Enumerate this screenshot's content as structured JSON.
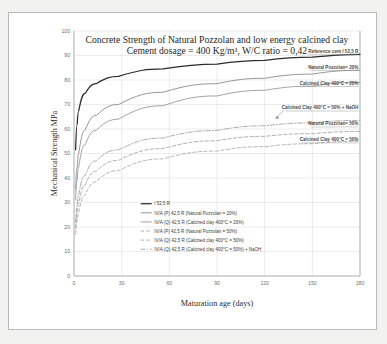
{
  "chart_data": {
    "type": "line",
    "title": "Concrete Strength of Natural Pozzolan and low energy calcined clay",
    "subtitle": "Cement dosage = 400 Kg/m³, W/C ratio = 0,42",
    "xlabel": "Maturation age (days)",
    "ylabel": "Mechanical Strength MPa",
    "xlim": [
      0,
      180
    ],
    "ylim": [
      0,
      100
    ],
    "xticks": [
      "0",
      "30",
      "60",
      "90",
      "120",
      "150",
      "180"
    ],
    "yticks": [
      "0",
      "10",
      "20",
      "30",
      "40",
      "50",
      "60",
      "70",
      "80",
      "90",
      "100"
    ],
    "grid": true,
    "legend_position": "inside-lower-center",
    "x": [
      1,
      2,
      3,
      7,
      14,
      28,
      56,
      90,
      120,
      150,
      180
    ],
    "series": [
      {
        "name": "I 52,5 R",
        "color": "#2b2b2b",
        "dash": "solid",
        "width": 1.25,
        "values": [
          51.5,
          62.0,
          67.5,
          74.5,
          78.5,
          81.5,
          84.5,
          86.5,
          88.0,
          89.3,
          90.5
        ]
      },
      {
        "name": "IV/A (P) 42,5 R  (Natural Pozzolan = 20%)",
        "color": "#8a8a8a",
        "dash": "solid",
        "width": 0.9,
        "values": [
          35.5,
          44.0,
          50.0,
          59.5,
          65.5,
          70.0,
          75.0,
          78.5,
          80.7,
          82.4,
          84.0
        ]
      },
      {
        "name": "IV/A (Q) 42,5 R  (Calcined clay 400°C = 20%)",
        "color": "#9a9a9a",
        "dash": "solid",
        "width": 0.9,
        "values": [
          31.0,
          39.0,
          44.5,
          53.5,
          59.5,
          64.0,
          69.5,
          73.5,
          75.8,
          77.5,
          79.0
        ]
      },
      {
        "name": "IV/A (Q) 42,5 R  (Calcined clay 400°C = 50%) + NaOH",
        "color": "#9a9a9a",
        "dash": "dashdot",
        "width": 0.85,
        "values": [
          22.0,
          28.5,
          33.0,
          41.0,
          47.0,
          51.5,
          56.3,
          59.4,
          61.3,
          62.5,
          63.5
        ]
      },
      {
        "name": "IV/A (P) 42,5 R  (Natural Pozzolan = 50%)",
        "color": "#a0a0a0",
        "dash": "dashed",
        "width": 0.85,
        "values": [
          19.5,
          25.5,
          29.5,
          37.0,
          42.8,
          47.2,
          52.0,
          55.2,
          57.0,
          58.1,
          59.0
        ]
      },
      {
        "name": "IV/A (Q) 42,5 R  (Calcined clay 400°C = 50%)",
        "color": "#a8a8a8",
        "dash": "dashed",
        "width": 0.85,
        "values": [
          17.0,
          22.5,
          26.0,
          33.0,
          38.5,
          43.0,
          47.8,
          51.0,
          52.8,
          54.0,
          55.0
        ]
      }
    ],
    "annotations": [
      {
        "text": "Reference cem I 52,5 R",
        "x": 179,
        "y": 91.0
      },
      {
        "text": "Natural Pozzolan= 20%",
        "x": 179,
        "y": 84.5
      },
      {
        "text": "Calcined Clay 400°C = 20%",
        "x": 179,
        "y": 78.0
      },
      {
        "text": "Calcined Clay 400°C = 50% + NaOH",
        "x": 179,
        "y": 68.0
      },
      {
        "text": "Natural Pozzolan= 50%",
        "x": 179,
        "y": 61.5
      },
      {
        "text": "Calcined Clay 400°C = 50%",
        "x": 179,
        "y": 55.0
      }
    ],
    "legend_entries": [
      {
        "label": "I 52,5 R",
        "color": "#2b2b2b",
        "dash": "solid",
        "width": 1.25
      },
      {
        "label": "IV/A (P) 42,5 R  (Natural Pozzolan = 20%)",
        "color": "#8a8a8a",
        "dash": "solid",
        "width": 0.9
      },
      {
        "label": "IV/A (Q) 42,5 R  (Calcined clay 400°C = 20%)",
        "color": "#9a9a9a",
        "dash": "solid",
        "width": 0.9
      },
      {
        "label": "IV/A (P) 42,5 R  (Natural Pozzolan = 50%)",
        "color": "#a0a0a0",
        "dash": "dashed",
        "width": 0.85
      },
      {
        "label": "IV/A (Q) 42,5 R  (Calcined clay 400°C = 50%)",
        "color": "#a8a8a8",
        "dash": "dashed",
        "width": 0.85
      },
      {
        "label": "IV/A (Q) 42,5 R  (Calcined clay 400°C = 50%) + NaOH",
        "color": "#9a9a9a",
        "dash": "dashdot",
        "width": 0.85
      }
    ]
  }
}
